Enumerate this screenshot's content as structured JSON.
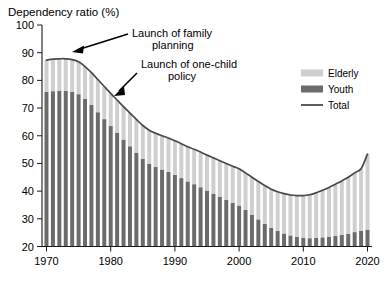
{
  "chart_data": {
    "type": "bar",
    "title": "",
    "ylabel": "Dependency ratio (%)",
    "xlabel": "",
    "ylim": [
      20,
      100
    ],
    "xlim": [
      1969.3,
      2020.7
    ],
    "yticks": [
      20,
      30,
      40,
      50,
      60,
      70,
      80,
      90,
      100
    ],
    "xticks": [
      1970,
      1980,
      1990,
      2000,
      2010,
      2020
    ],
    "grid": false,
    "legend_position": "top-right",
    "stacked": true,
    "categories": [
      1970,
      1971,
      1972,
      1973,
      1974,
      1975,
      1976,
      1977,
      1978,
      1979,
      1980,
      1981,
      1982,
      1983,
      1984,
      1985,
      1986,
      1987,
      1988,
      1989,
      1990,
      1991,
      1992,
      1993,
      1994,
      1995,
      1996,
      1997,
      1998,
      1999,
      2000,
      2001,
      2002,
      2003,
      2004,
      2005,
      2006,
      2007,
      2008,
      2009,
      2010,
      2011,
      2012,
      2013,
      2014,
      2015,
      2016,
      2017,
      2018,
      2019,
      2020
    ],
    "series": [
      {
        "name": "Youth",
        "color": "#6b6b6b",
        "values": [
          75.8,
          76.1,
          76.2,
          76.2,
          75.9,
          75.0,
          73.3,
          71.1,
          68.5,
          66.0,
          63.5,
          61.0,
          58.6,
          56.2,
          53.9,
          51.6,
          49.9,
          48.7,
          47.8,
          46.9,
          45.9,
          44.7,
          43.5,
          42.5,
          41.4,
          40.2,
          39.1,
          38.0,
          36.9,
          35.8,
          34.8,
          33.2,
          31.5,
          29.8,
          28.2,
          26.7,
          25.6,
          24.7,
          24.0,
          23.5,
          23.2,
          23.0,
          23.1,
          23.3,
          23.6,
          23.9,
          24.2,
          24.6,
          25.2,
          25.6,
          26.1
        ]
      },
      {
        "name": "Elderly",
        "color": "#cfcfcf",
        "values": [
          11.5,
          11.6,
          11.6,
          11.6,
          11.6,
          11.7,
          11.7,
          11.7,
          11.8,
          11.8,
          11.8,
          11.9,
          11.9,
          12.0,
          12.0,
          12.1,
          12.1,
          12.2,
          12.2,
          12.3,
          12.3,
          12.4,
          12.5,
          12.6,
          12.7,
          12.8,
          12.9,
          13.0,
          13.1,
          13.2,
          13.3,
          13.4,
          13.5,
          13.7,
          13.8,
          14.0,
          14.2,
          14.4,
          14.6,
          14.9,
          15.2,
          15.7,
          16.3,
          17.0,
          17.7,
          18.6,
          19.5,
          20.4,
          21.4,
          22.5,
          27.3
        ]
      }
    ],
    "total_line": {
      "name": "Total",
      "color": "#4a4a4a",
      "values": [
        87.3,
        87.7,
        87.8,
        87.8,
        87.5,
        86.7,
        85.0,
        82.8,
        80.3,
        77.8,
        75.3,
        72.9,
        70.5,
        68.2,
        65.9,
        63.7,
        62.0,
        60.9,
        60.0,
        59.2,
        58.2,
        57.1,
        56.0,
        55.1,
        54.1,
        53.0,
        52.0,
        51.0,
        50.0,
        49.0,
        48.1,
        46.6,
        45.0,
        43.5,
        42.0,
        40.7,
        39.8,
        39.1,
        38.6,
        38.4,
        38.4,
        38.7,
        39.4,
        40.3,
        41.3,
        42.5,
        43.7,
        45.0,
        46.6,
        48.1,
        53.4
      ]
    },
    "annotations": [
      {
        "text_line1": "Launch of family",
        "text_line2": "planning",
        "points_to_year": 1973,
        "points_to_value": 91.5
      },
      {
        "text_line1": "Launch of one-child",
        "text_line2": "policy",
        "points_to_year": 1980,
        "points_to_value": 77.5
      }
    ],
    "legend": [
      {
        "label": "Elderly",
        "color": "#cfcfcf",
        "marker": "swatch"
      },
      {
        "label": "Youth",
        "color": "#6b6b6b",
        "marker": "swatch"
      },
      {
        "label": "Total",
        "color": "#4a4a4a",
        "marker": "line"
      }
    ]
  },
  "axis": {
    "y_title": "Dependency ratio (%)",
    "ytick_labels": [
      "100",
      "90",
      "80",
      "70",
      "60",
      "50",
      "40",
      "30",
      "20"
    ],
    "xtick_labels": [
      "1970",
      "1980",
      "1990",
      "2000",
      "2010",
      "2020"
    ]
  }
}
